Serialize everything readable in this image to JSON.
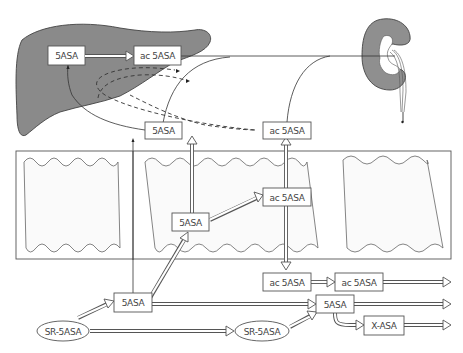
{
  "diagram": {
    "organs": {
      "liver": {
        "label": "liver",
        "fill": "#8a8a8a"
      },
      "kidney": {
        "label": "kidney",
        "fill": "#8f8f8f"
      }
    },
    "nodes": {
      "liver_5asa": "5ASA",
      "liver_ac5asa": "ac 5ASA",
      "blood_5asa": "5ASA",
      "blood_ac5asa": "ac 5ASA",
      "cell_5asa": "5ASA",
      "cell_ac5asa": "ac 5ASA",
      "lumen_ac5asa_1": "ac 5ASA",
      "lumen_ac5asa_2": "ac 5ASA",
      "lumen_5asa_upper": "5ASA",
      "lumen_5asa_lower": "5ASA",
      "sr5asa_1": "SR-5ASA",
      "sr5asa_2": "SR-5ASA",
      "x_asa": "X-ASA"
    },
    "colors": {
      "line": "#333333",
      "box_border": "#555555",
      "organ_fill": "#8a8a8a"
    }
  }
}
